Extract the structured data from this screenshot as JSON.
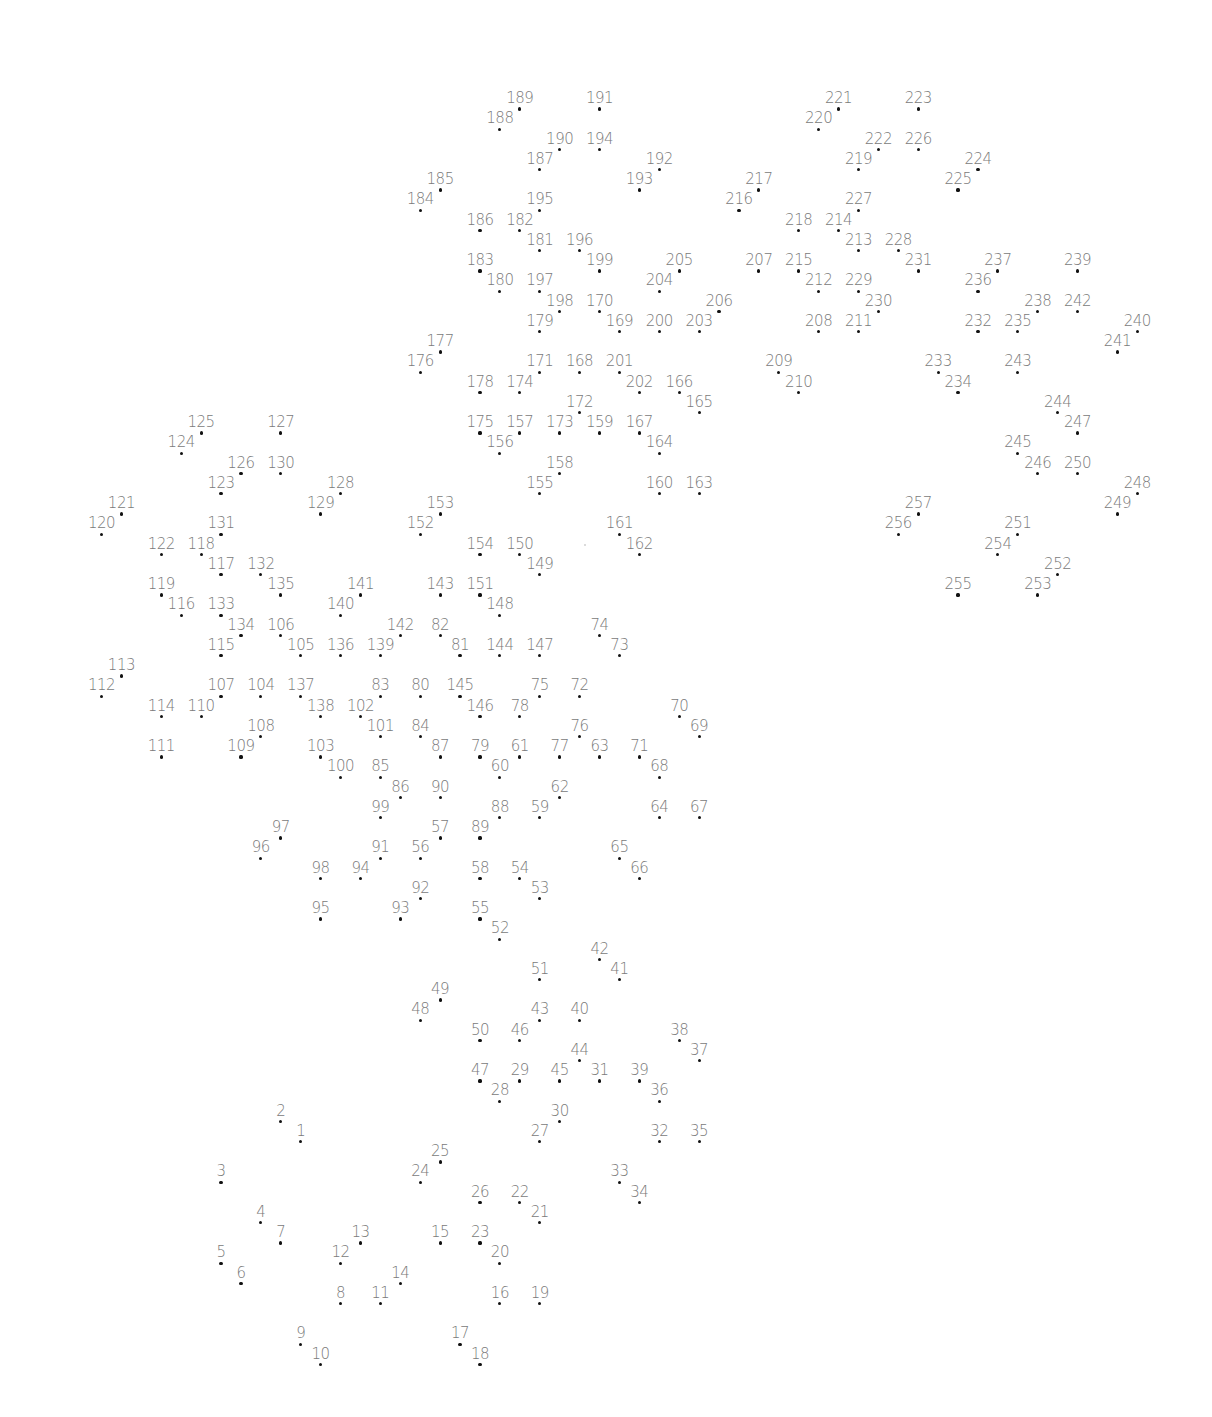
{
  "puzzle": {
    "type": "connect-the-dots",
    "total_points": 257,
    "grid": {
      "x0": 101.5,
      "dx": 19.92,
      "y0": 109,
      "dy": 20.25
    },
    "colors": {
      "background": "#ffffff",
      "dot": "#111111",
      "label": "#7a7a7a"
    },
    "points": [
      [
        1,
        10,
        51
      ],
      [
        2,
        9,
        50
      ],
      [
        3,
        6,
        53
      ],
      [
        4,
        8,
        55
      ],
      [
        5,
        6,
        57
      ],
      [
        6,
        7,
        58
      ],
      [
        7,
        9,
        56
      ],
      [
        8,
        12,
        59
      ],
      [
        9,
        10,
        61
      ],
      [
        10,
        11,
        62
      ],
      [
        11,
        14,
        59
      ],
      [
        12,
        12,
        57
      ],
      [
        13,
        13,
        56
      ],
      [
        14,
        15,
        58
      ],
      [
        15,
        17,
        56
      ],
      [
        16,
        20,
        59
      ],
      [
        17,
        18,
        61
      ],
      [
        18,
        19,
        62
      ],
      [
        19,
        22,
        59
      ],
      [
        20,
        20,
        57
      ],
      [
        21,
        22,
        55
      ],
      [
        22,
        21,
        54
      ],
      [
        23,
        19,
        56
      ],
      [
        24,
        16,
        53
      ],
      [
        25,
        17,
        52
      ],
      [
        26,
        19,
        54
      ],
      [
        27,
        22,
        51
      ],
      [
        28,
        20,
        49
      ],
      [
        29,
        21,
        48
      ],
      [
        30,
        23,
        50
      ],
      [
        31,
        25,
        48
      ],
      [
        32,
        28,
        51
      ],
      [
        33,
        26,
        53
      ],
      [
        34,
        27,
        54
      ],
      [
        35,
        30,
        51
      ],
      [
        36,
        28,
        49
      ],
      [
        37,
        30,
        47
      ],
      [
        38,
        29,
        46
      ],
      [
        39,
        27,
        48
      ],
      [
        40,
        24,
        45
      ],
      [
        41,
        26,
        43
      ],
      [
        42,
        25,
        42
      ],
      [
        43,
        22,
        45
      ],
      [
        44,
        24,
        47
      ],
      [
        45,
        23,
        48
      ],
      [
        46,
        21,
        46
      ],
      [
        47,
        19,
        48
      ],
      [
        48,
        16,
        45
      ],
      [
        49,
        17,
        44
      ],
      [
        50,
        19,
        46
      ],
      [
        51,
        22,
        43
      ],
      [
        52,
        20,
        41
      ],
      [
        53,
        22,
        39
      ],
      [
        54,
        21,
        38
      ],
      [
        55,
        19,
        40
      ],
      [
        56,
        16,
        37
      ],
      [
        57,
        17,
        36
      ],
      [
        58,
        19,
        38
      ],
      [
        59,
        22,
        35
      ],
      [
        60,
        20,
        33
      ],
      [
        61,
        21,
        32
      ],
      [
        62,
        23,
        34
      ],
      [
        63,
        25,
        32
      ],
      [
        64,
        28,
        35
      ],
      [
        65,
        26,
        37
      ],
      [
        66,
        27,
        38
      ],
      [
        67,
        30,
        35
      ],
      [
        68,
        28,
        33
      ],
      [
        69,
        30,
        31
      ],
      [
        70,
        29,
        30
      ],
      [
        71,
        27,
        32
      ],
      [
        72,
        24,
        29
      ],
      [
        73,
        26,
        27
      ],
      [
        74,
        25,
        26
      ],
      [
        75,
        22,
        29
      ],
      [
        76,
        24,
        31
      ],
      [
        77,
        23,
        32
      ],
      [
        78,
        21,
        30
      ],
      [
        79,
        19,
        32
      ],
      [
        80,
        16,
        29
      ],
      [
        81,
        18,
        27
      ],
      [
        82,
        17,
        26
      ],
      [
        83,
        14,
        29
      ],
      [
        84,
        16,
        31
      ],
      [
        85,
        14,
        33
      ],
      [
        86,
        15,
        34
      ],
      [
        87,
        17,
        32
      ],
      [
        88,
        20,
        35
      ],
      [
        89,
        19,
        36
      ],
      [
        90,
        17,
        34
      ],
      [
        91,
        14,
        37
      ],
      [
        92,
        16,
        39
      ],
      [
        93,
        15,
        40
      ],
      [
        94,
        13,
        38
      ],
      [
        95,
        11,
        40
      ],
      [
        96,
        8,
        37
      ],
      [
        97,
        9,
        36
      ],
      [
        98,
        11,
        38
      ],
      [
        99,
        14,
        35
      ],
      [
        100,
        12,
        33
      ],
      [
        101,
        14,
        31
      ],
      [
        102,
        13,
        30
      ],
      [
        103,
        11,
        32
      ],
      [
        104,
        8,
        29
      ],
      [
        105,
        10,
        27
      ],
      [
        106,
        9,
        26
      ],
      [
        107,
        6,
        29
      ],
      [
        108,
        8,
        31
      ],
      [
        109,
        7,
        32
      ],
      [
        110,
        5,
        30
      ],
      [
        111,
        3,
        32
      ],
      [
        112,
        0,
        29
      ],
      [
        113,
        1,
        28
      ],
      [
        114,
        3,
        30
      ],
      [
        115,
        6,
        27
      ],
      [
        116,
        4,
        25
      ],
      [
        117,
        6,
        23
      ],
      [
        118,
        5,
        22
      ],
      [
        119,
        3,
        24
      ],
      [
        120,
        0,
        21
      ],
      [
        121,
        1,
        20
      ],
      [
        122,
        3,
        22
      ],
      [
        123,
        6,
        19
      ],
      [
        124,
        4,
        17
      ],
      [
        125,
        5,
        16
      ],
      [
        126,
        7,
        18
      ],
      [
        127,
        9,
        16
      ],
      [
        128,
        12,
        19
      ],
      [
        129,
        11,
        20
      ],
      [
        130,
        9,
        18
      ],
      [
        131,
        6,
        21
      ],
      [
        132,
        8,
        23
      ],
      [
        133,
        6,
        25
      ],
      [
        134,
        7,
        26
      ],
      [
        135,
        9,
        24
      ],
      [
        136,
        12,
        27
      ],
      [
        137,
        10,
        29
      ],
      [
        138,
        11,
        30
      ],
      [
        139,
        14,
        27
      ],
      [
        140,
        12,
        25
      ],
      [
        141,
        13,
        24
      ],
      [
        142,
        15,
        26
      ],
      [
        143,
        17,
        24
      ],
      [
        144,
        20,
        27
      ],
      [
        145,
        18,
        29
      ],
      [
        146,
        19,
        30
      ],
      [
        147,
        22,
        27
      ],
      [
        148,
        20,
        25
      ],
      [
        149,
        22,
        23
      ],
      [
        150,
        21,
        22
      ],
      [
        151,
        19,
        24
      ],
      [
        152,
        16,
        21
      ],
      [
        153,
        17,
        20
      ],
      [
        154,
        19,
        22
      ],
      [
        155,
        22,
        19
      ],
      [
        156,
        20,
        17
      ],
      [
        157,
        21,
        16
      ],
      [
        158,
        23,
        18
      ],
      [
        159,
        25,
        16
      ],
      [
        160,
        28,
        19
      ],
      [
        161,
        26,
        21
      ],
      [
        162,
        27,
        22
      ],
      [
        163,
        30,
        19
      ],
      [
        164,
        28,
        17
      ],
      [
        165,
        30,
        15
      ],
      [
        166,
        29,
        14
      ],
      [
        167,
        27,
        16
      ],
      [
        168,
        24,
        13
      ],
      [
        169,
        26,
        11
      ],
      [
        170,
        25,
        10
      ],
      [
        171,
        22,
        13
      ],
      [
        172,
        24,
        15
      ],
      [
        173,
        23,
        16
      ],
      [
        174,
        21,
        14
      ],
      [
        175,
        19,
        16
      ],
      [
        176,
        16,
        13
      ],
      [
        177,
        17,
        12
      ],
      [
        178,
        19,
        14
      ],
      [
        179,
        22,
        11
      ],
      [
        180,
        20,
        9
      ],
      [
        181,
        22,
        7
      ],
      [
        182,
        21,
        6
      ],
      [
        183,
        19,
        8
      ],
      [
        184,
        16,
        5
      ],
      [
        185,
        17,
        4
      ],
      [
        186,
        19,
        6
      ],
      [
        187,
        22,
        3
      ],
      [
        188,
        20,
        1
      ],
      [
        189,
        21,
        0
      ],
      [
        190,
        23,
        2
      ],
      [
        191,
        25,
        0
      ],
      [
        192,
        28,
        3
      ],
      [
        193,
        27,
        4
      ],
      [
        194,
        25,
        2
      ],
      [
        195,
        22,
        5
      ],
      [
        196,
        24,
        7
      ],
      [
        197,
        22,
        9
      ],
      [
        198,
        23,
        10
      ],
      [
        199,
        25,
        8
      ],
      [
        200,
        28,
        11
      ],
      [
        201,
        26,
        13
      ],
      [
        202,
        27,
        14
      ],
      [
        203,
        30,
        11
      ],
      [
        204,
        28,
        9
      ],
      [
        205,
        29,
        8
      ],
      [
        206,
        31,
        10
      ],
      [
        207,
        33,
        8
      ],
      [
        208,
        36,
        11
      ],
      [
        209,
        34,
        13
      ],
      [
        210,
        35,
        14
      ],
      [
        211,
        38,
        11
      ],
      [
        212,
        36,
        9
      ],
      [
        213,
        38,
        7
      ],
      [
        214,
        37,
        6
      ],
      [
        215,
        35,
        8
      ],
      [
        216,
        32,
        5
      ],
      [
        217,
        33,
        4
      ],
      [
        218,
        35,
        6
      ],
      [
        219,
        38,
        3
      ],
      [
        220,
        36,
        1
      ],
      [
        221,
        37,
        0
      ],
      [
        222,
        39,
        2
      ],
      [
        223,
        41,
        0
      ],
      [
        224,
        44,
        3
      ],
      [
        225,
        43,
        4
      ],
      [
        226,
        41,
        2
      ],
      [
        227,
        38,
        5
      ],
      [
        228,
        40,
        7
      ],
      [
        229,
        38,
        9
      ],
      [
        230,
        39,
        10
      ],
      [
        231,
        41,
        8
      ],
      [
        232,
        44,
        11
      ],
      [
        233,
        42,
        13
      ],
      [
        234,
        43,
        14
      ],
      [
        235,
        46,
        11
      ],
      [
        236,
        44,
        9
      ],
      [
        237,
        45,
        8
      ],
      [
        238,
        47,
        10
      ],
      [
        239,
        49,
        8
      ],
      [
        240,
        52,
        11
      ],
      [
        241,
        51,
        12
      ],
      [
        242,
        49,
        10
      ],
      [
        243,
        46,
        13
      ],
      [
        244,
        48,
        15
      ],
      [
        245,
        46,
        17
      ],
      [
        246,
        47,
        18
      ],
      [
        247,
        49,
        16
      ],
      [
        248,
        52,
        19
      ],
      [
        249,
        51,
        20
      ],
      [
        250,
        49,
        18
      ],
      [
        251,
        46,
        21
      ],
      [
        252,
        48,
        23
      ],
      [
        253,
        47,
        24
      ],
      [
        254,
        45,
        22
      ],
      [
        255,
        43,
        24
      ],
      [
        256,
        40,
        21
      ],
      [
        257,
        41,
        20
      ]
    ],
    "specks": [
      [
        585,
        545
      ]
    ]
  }
}
